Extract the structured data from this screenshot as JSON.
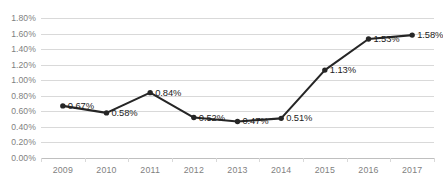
{
  "chart_data": {
    "type": "line",
    "title": "",
    "subtitle": "",
    "xlabel": "",
    "ylabel": "",
    "grid": true,
    "legend": false,
    "legend_position": "none",
    "ylim": [
      0,
      1.8
    ],
    "yticks": [
      "0.00%",
      "0.20%",
      "0.40%",
      "0.60%",
      "0.80%",
      "1.00%",
      "1.20%",
      "1.40%",
      "1.60%",
      "1.80%"
    ],
    "ytick_values": [
      0.0,
      0.2,
      0.4,
      0.6,
      0.8,
      1.0,
      1.2,
      1.4,
      1.6,
      1.8
    ],
    "categories": [
      "2009",
      "2010",
      "2011",
      "2012",
      "2013",
      "2014",
      "2015",
      "2016",
      "2017"
    ],
    "values": [
      0.67,
      0.58,
      0.84,
      0.52,
      0.47,
      0.51,
      1.13,
      1.53,
      1.58
    ],
    "data_labels": [
      "0.67%",
      "0.58%",
      "0.84%",
      "0.52%",
      "0.47%",
      "0.51%",
      "1.13%",
      "1.53%",
      "1.58%"
    ],
    "series": [
      {
        "name": "",
        "values": [
          0.67,
          0.58,
          0.84,
          0.52,
          0.47,
          0.51,
          1.13,
          1.53,
          1.58
        ],
        "color": "#262626",
        "marker": "circle"
      }
    ]
  },
  "colors": {
    "line": "#262626",
    "marker": "#262626",
    "gridline": "#d9d9d9",
    "axis": "#bfbfbf",
    "tick_text": "#7f7f7f",
    "label_text": "#1c1c1c",
    "background": "#ffffff"
  }
}
